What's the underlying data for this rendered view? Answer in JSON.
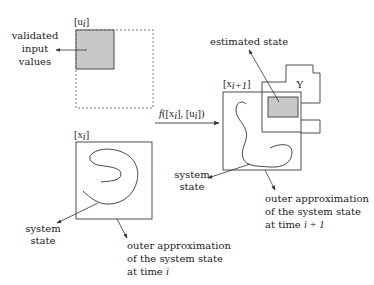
{
  "diagram": {
    "colors": {
      "stroke": "#3a3a3a",
      "fill_gray": "#c8c8c8",
      "text": "#222222"
    },
    "input_set": {
      "label": "[u",
      "label_sub": "i",
      "label_close": "]",
      "annotation_lines": [
        "validated",
        "input",
        "values"
      ]
    },
    "state_set_i": {
      "label": "[x",
      "label_sub": "i",
      "label_close": "]",
      "system_state_lines": [
        "system",
        "state"
      ],
      "outer_lines": [
        "outer approximation",
        "of the system state",
        "at time "
      ],
      "outer_time": "i"
    },
    "mapping": {
      "label_f": "f",
      "label_rest_open": "([x",
      "label_sub1": "i",
      "label_mid": "], [u",
      "label_sub2": "i",
      "label_close": "])"
    },
    "state_set_next": {
      "label": "[x",
      "label_sub": "i+1",
      "label_close": "]",
      "system_state_lines": [
        "system",
        "state"
      ],
      "outer_lines": [
        "outer approximation",
        "of the system state",
        "at time "
      ],
      "outer_time": "i + 1"
    },
    "measurement_set": {
      "label": "Y",
      "estimated_label": "estimated state"
    }
  }
}
